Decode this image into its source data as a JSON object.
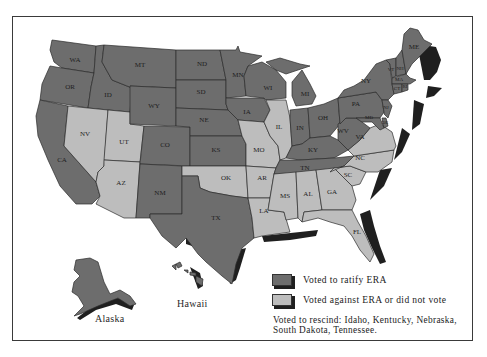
{
  "colors": {
    "ratified": "#6d6d6d",
    "not_ratified": "#bdbdbd",
    "shadow": "#1f1f1f",
    "border": "#2b2b2b",
    "background": "#ffffff"
  },
  "map": {
    "title": "",
    "insets": {
      "alaska_label": "Alaska",
      "hawaii_label": "Hawaii"
    },
    "states": {
      "WA": {
        "label": "WA",
        "status": "ratified"
      },
      "OR": {
        "label": "OR",
        "status": "ratified"
      },
      "CA": {
        "label": "CA",
        "status": "ratified"
      },
      "ID": {
        "label": "ID",
        "status": "ratified"
      },
      "NV": {
        "label": "NV",
        "status": "not_ratified"
      },
      "UT": {
        "label": "UT",
        "status": "not_ratified"
      },
      "AZ": {
        "label": "AZ",
        "status": "not_ratified"
      },
      "MT": {
        "label": "MT",
        "status": "ratified"
      },
      "WY": {
        "label": "WY",
        "status": "ratified"
      },
      "CO": {
        "label": "CO",
        "status": "ratified"
      },
      "NM": {
        "label": "NM",
        "status": "ratified"
      },
      "ND": {
        "label": "ND",
        "status": "ratified"
      },
      "SD": {
        "label": "SD",
        "status": "ratified"
      },
      "NE": {
        "label": "NE",
        "status": "ratified"
      },
      "KS": {
        "label": "KS",
        "status": "ratified"
      },
      "OK": {
        "label": "OK",
        "status": "not_ratified"
      },
      "TX": {
        "label": "TX",
        "status": "ratified"
      },
      "MN": {
        "label": "MN",
        "status": "ratified"
      },
      "IA": {
        "label": "IA",
        "status": "ratified"
      },
      "MO": {
        "label": "MO",
        "status": "not_ratified"
      },
      "AR": {
        "label": "AR",
        "status": "not_ratified"
      },
      "LA": {
        "label": "LA",
        "status": "not_ratified"
      },
      "WI": {
        "label": "WI",
        "status": "ratified"
      },
      "IL": {
        "label": "IL",
        "status": "not_ratified"
      },
      "MI": {
        "label": "MI",
        "status": "ratified"
      },
      "IN": {
        "label": "IN",
        "status": "ratified"
      },
      "OH": {
        "label": "OH",
        "status": "ratified"
      },
      "KY": {
        "label": "KY",
        "status": "ratified"
      },
      "TN": {
        "label": "TN",
        "status": "ratified"
      },
      "MS": {
        "label": "MS",
        "status": "not_ratified"
      },
      "AL": {
        "label": "AL",
        "status": "not_ratified"
      },
      "GA": {
        "label": "GA",
        "status": "not_ratified"
      },
      "FL": {
        "label": "FL",
        "status": "not_ratified"
      },
      "SC": {
        "label": "SC",
        "status": "not_ratified"
      },
      "NC": {
        "label": "NC",
        "status": "not_ratified"
      },
      "VA": {
        "label": "VA",
        "status": "not_ratified"
      },
      "WV": {
        "label": "WV",
        "status": "ratified"
      },
      "PA": {
        "label": "PA",
        "status": "ratified"
      },
      "NY": {
        "label": "NY",
        "status": "ratified"
      },
      "VT": {
        "label": "VT",
        "status": "ratified"
      },
      "NH": {
        "label": "NH",
        "status": "ratified"
      },
      "ME": {
        "label": "ME",
        "status": "ratified"
      },
      "MA": {
        "label": "MA",
        "status": "ratified"
      },
      "RI": {
        "label": "RI",
        "status": "ratified"
      },
      "CT": {
        "label": "CT",
        "status": "ratified"
      },
      "NJ": {
        "label": "NJ",
        "status": "ratified"
      },
      "DE": {
        "label": "DE",
        "status": "ratified"
      },
      "MD": {
        "label": "MD",
        "status": "ratified"
      },
      "AK": {
        "label": "",
        "status": "ratified"
      },
      "HI": {
        "label": "",
        "status": "ratified"
      }
    }
  },
  "legend": {
    "items": [
      {
        "label": "Voted to ratify ERA",
        "status": "ratified"
      },
      {
        "label": "Voted against ERA or did not vote",
        "status": "not_ratified"
      }
    ],
    "note": "Voted to rescind: Idaho, Kentucky, Nebraska, South Dakota, Tennessee."
  }
}
